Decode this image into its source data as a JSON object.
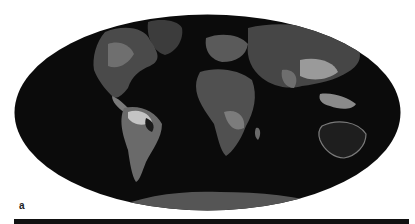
{
  "figure": {
    "panel_label": "a",
    "projection": "Mollweide",
    "color_scheme": "grayscale",
    "colors": {
      "background": "#ffffff",
      "ocean": "#0b0b0b",
      "land_low": "#3a3a3a",
      "land_mid": "#6a6a6a",
      "land_high": "#b5b5b5",
      "antarctica": "#555555",
      "bar": "#111111"
    },
    "regions": [
      {
        "name": "North America"
      },
      {
        "name": "South America"
      },
      {
        "name": "Europe"
      },
      {
        "name": "Africa"
      },
      {
        "name": "Asia"
      },
      {
        "name": "Australia"
      },
      {
        "name": "Antarctica"
      },
      {
        "name": "Greenland"
      }
    ]
  }
}
